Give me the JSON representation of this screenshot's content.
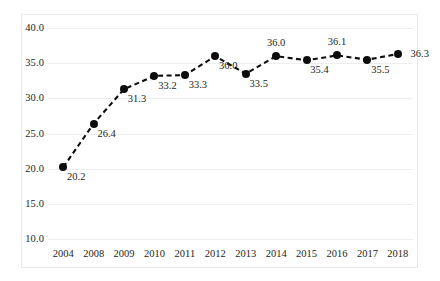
{
  "chart_data": {
    "type": "line",
    "title": "",
    "subtitle": "",
    "xlabel": "",
    "ylabel": "",
    "categories": [
      "2004",
      "2008",
      "2009",
      "2010",
      "2011",
      "2012",
      "2013",
      "2014",
      "2015",
      "2016",
      "2017",
      "2018"
    ],
    "values": [
      20.2,
      26.4,
      31.3,
      33.2,
      33.3,
      36.0,
      33.5,
      36.0,
      35.4,
      36.1,
      35.5,
      36.3
    ],
    "data_labels": [
      "20.2",
      "26.4",
      "31.3",
      "33.2",
      "33.3",
      "36.0",
      "33.5",
      "36.0",
      "35.4",
      "36.1",
      "35.5",
      "36.3"
    ],
    "label_positions": [
      "below",
      "below",
      "below",
      "below",
      "below",
      "below",
      "below",
      "above",
      "below",
      "above",
      "below",
      "right"
    ],
    "ylim": [
      10.0,
      40.0
    ],
    "ytick_labels": [
      "40.0",
      "35.0",
      "30.0",
      "25.0",
      "20.0",
      "15.0",
      "10.0"
    ],
    "ytick_values": [
      40.0,
      35.0,
      30.0,
      25.0,
      20.0,
      15.0,
      10.0
    ],
    "grid": true,
    "legend": "none",
    "line_style": "dashed",
    "marker": "circle",
    "series_color": "#0d0d0d",
    "gridline_color": "#ededed",
    "background_color": "#ffffff",
    "frame_color": "#e9e9e9"
  }
}
